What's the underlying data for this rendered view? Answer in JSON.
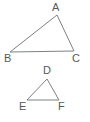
{
  "figure": {
    "background_color": "#ffffff",
    "stroke_color": "#7d8184",
    "label_color": "#55595c",
    "stroke_width": 1,
    "width": 90,
    "height": 122,
    "shapes": [
      {
        "name": "triangle-abc",
        "type": "triangle",
        "points": "57,15 74,51 10,52",
        "vertices": [
          {
            "label": "A",
            "x": 57,
            "y": 15
          },
          {
            "label": "B",
            "x": 10,
            "y": 52
          },
          {
            "label": "C",
            "x": 74,
            "y": 51
          }
        ]
      },
      {
        "name": "triangle-def",
        "type": "triangle",
        "points": "47,79 59,100 27,100",
        "vertices": [
          {
            "label": "D",
            "x": 47,
            "y": 79
          },
          {
            "label": "E",
            "x": 27,
            "y": 100
          },
          {
            "label": "F",
            "x": 59,
            "y": 100
          }
        ]
      }
    ],
    "labels": {
      "a": "A",
      "b": "B",
      "c": "C",
      "d": "D",
      "e": "E",
      "f": "F"
    }
  }
}
